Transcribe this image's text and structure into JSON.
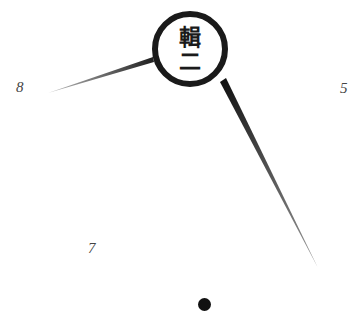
{
  "clock": {
    "hub": {
      "line1": "輯",
      "line2": "二",
      "ring_color": "#1a1a1a"
    },
    "numerals": {
      "eight": "8",
      "five": "5",
      "seven": "7"
    },
    "hands": [
      {
        "name": "hour-hand",
        "from": [
          152,
          60
        ],
        "to": [
          48,
          93
        ]
      },
      {
        "name": "minute-hand",
        "from": [
          222,
          80
        ],
        "to": [
          318,
          268
        ]
      }
    ],
    "dot_color": "#111111"
  }
}
